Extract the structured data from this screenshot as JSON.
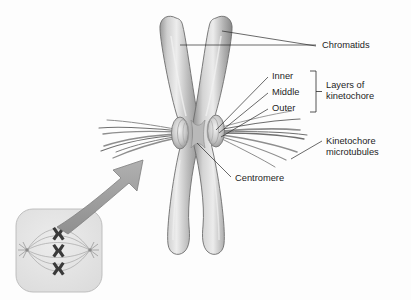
{
  "figure": {
    "background_color": "#fdfdfd",
    "ink_color": "#1d1d1d",
    "chromatid_fill_light": "#e3e3e3",
    "chromatid_fill_mid": "#b5b5b5",
    "chromatid_fill_dark": "#8a8a8a",
    "microtubule_color": "#8e8e8e",
    "arrow_color": "#9e9e9e",
    "inset_fill": "#e7e7e7"
  },
  "labels": {
    "chromatids": "Chromatids",
    "inner": "Inner",
    "middle": "Middle",
    "outer": "Outer",
    "layers_line1": "Layers of",
    "layers_line2": "kinetochore",
    "kinetochore_mt_line1": "Kinetochore",
    "kinetochore_mt_line2": "microtubules",
    "centromere": "Centromere"
  },
  "inset": {
    "name": "cell-in-metaphase",
    "chromosome_count": 3,
    "pole_count": 2
  }
}
